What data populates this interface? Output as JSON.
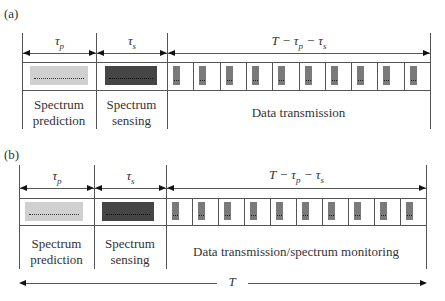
{
  "panels": [
    {
      "id": "a",
      "label": "(a)",
      "durations": {
        "prediction": "τp",
        "sensing": "τs",
        "data": "T−τp−τs"
      },
      "captions": {
        "prediction": [
          "Spectrum",
          "prediction"
        ],
        "sensing": [
          "Spectrum",
          "sensing"
        ],
        "data": "Data transmission"
      },
      "slot_count": 10
    },
    {
      "id": "b",
      "label": "(b)",
      "durations": {
        "prediction": "τp",
        "sensing": "τs",
        "data": "T−τp−τs"
      },
      "captions": {
        "prediction": [
          "Spectrum",
          "prediction"
        ],
        "sensing": [
          "Spectrum",
          "sensing"
        ],
        "data": "Data transmission/spectrum monitoring"
      },
      "slot_count": 10
    }
  ],
  "total_period_label": "T",
  "colors": {
    "prediction_block": "#d0d0d0",
    "sensing_block": "#454545",
    "slot_bar": "#7a7a7a",
    "line": "#555555"
  }
}
